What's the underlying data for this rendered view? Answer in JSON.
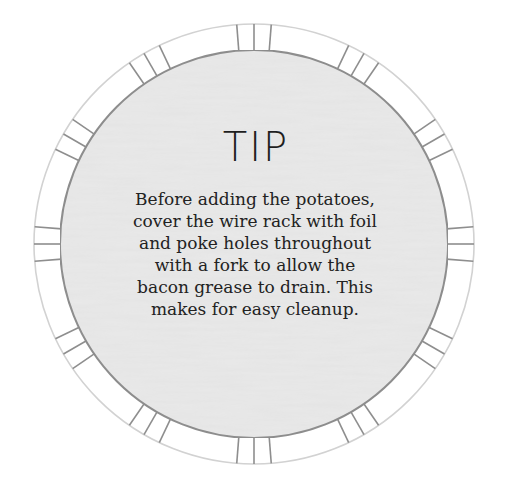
{
  "tip_card": {
    "title": "TIP",
    "body_lines": [
      "Before adding the potatoes,",
      "cover the wire rack with foil",
      "and poke holes throughout",
      "with a fork to allow the",
      "bacon grease to drain. This",
      "makes for easy cleanup."
    ],
    "colors": {
      "background": "#ffffff",
      "inner_fill": "#e9e9e9",
      "inner_border": "#8a8a8a",
      "outer_border": "#cfcfcf",
      "tick": "#8a8a8a",
      "text": "#222222"
    },
    "ring": {
      "center_x": 254,
      "center_y": 244,
      "outer_radius": 220,
      "inner_radius": 194,
      "tick_groups": 12,
      "ticks_per_group": 3
    }
  }
}
